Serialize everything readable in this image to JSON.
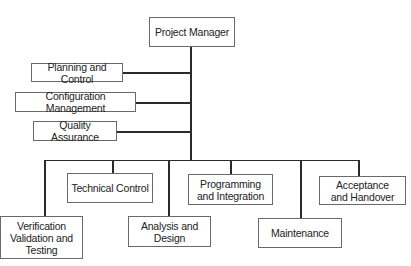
{
  "diagram": {
    "type": "org-chart",
    "root": {
      "label": "Project Manager"
    },
    "staff": [
      {
        "label": "Planning and Control"
      },
      {
        "label": "Configuration Management"
      },
      {
        "label": "Quality Assurance"
      }
    ],
    "subordinates": [
      {
        "label": "Verification\nValidation and\nTesting"
      },
      {
        "label": "Technical Control"
      },
      {
        "label": "Analysis and\nDesign"
      },
      {
        "label": "Programming\nand Integration"
      },
      {
        "label": "Maintenance"
      },
      {
        "label": "Acceptance\nand Handover"
      }
    ],
    "colors": {
      "line": "#2a2a2a",
      "border": "#6a6a6a",
      "background": "#ffffff",
      "text": "#222222"
    }
  }
}
